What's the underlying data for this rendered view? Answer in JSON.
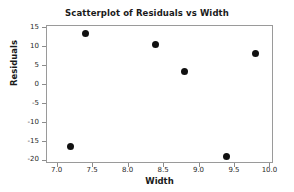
{
  "chart_data": {
    "type": "scatter",
    "title": "Scatterplot of Residuals vs Width",
    "xlabel": "Width",
    "ylabel": "Residuals",
    "xlim": [
      6.85,
      10.05
    ],
    "ylim": [
      -20.8,
      15.6
    ],
    "xticks": [
      "7.0",
      "7.5",
      "8.0",
      "8.5",
      "9.0",
      "9.5",
      "10.0"
    ],
    "xtick_values": [
      7.0,
      7.5,
      8.0,
      8.5,
      9.0,
      9.5,
      10.0
    ],
    "yticks": [
      "15",
      "10",
      "5",
      "0",
      "-5",
      "-10",
      "-15",
      "-20"
    ],
    "ytick_values": [
      15,
      10,
      5,
      0,
      -5,
      -10,
      -15,
      -20
    ],
    "grid": false,
    "legend": false,
    "marker": "filled-circle",
    "marker_color": "#111111",
    "frame_color": "#9a9a9a",
    "background": "#ffffff",
    "points": [
      {
        "x": 7.2,
        "y": -16.5
      },
      {
        "x": 7.4,
        "y": 13.3
      },
      {
        "x": 8.4,
        "y": 10.4
      },
      {
        "x": 8.8,
        "y": 3.4
      },
      {
        "x": 9.4,
        "y": -19.0
      },
      {
        "x": 9.8,
        "y": 8.1
      }
    ]
  }
}
